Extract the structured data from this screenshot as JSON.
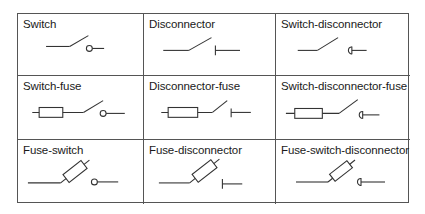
{
  "diagram": {
    "line_color": "#333333",
    "border_color": "#555555",
    "cells": [
      {
        "label": "Switch",
        "row": 1,
        "col": 1,
        "symbol": "switch-icon",
        "contact": "circle",
        "fuse": "none"
      },
      {
        "label": "Disconnector",
        "row": 1,
        "col": 2,
        "symbol": "disconnector-icon",
        "contact": "bar",
        "fuse": "none"
      },
      {
        "label": "Switch-disconnector",
        "row": 1,
        "col": 3,
        "symbol": "switch-disconnector-icon",
        "contact": "half-circle-bar",
        "fuse": "none"
      },
      {
        "label": "Switch-fuse",
        "row": 2,
        "col": 1,
        "symbol": "switch-fuse-icon",
        "contact": "circle",
        "fuse": "in-line"
      },
      {
        "label": "Disconnector-fuse",
        "row": 2,
        "col": 2,
        "symbol": "disconnector-fuse-icon",
        "contact": "bar",
        "fuse": "in-line"
      },
      {
        "label": "Switch-disconnector-fuse",
        "row": 2,
        "col": 3,
        "symbol": "switch-disconnector-fuse-icon",
        "contact": "half-circle-bar",
        "fuse": "in-line"
      },
      {
        "label": "Fuse-switch",
        "row": 3,
        "col": 1,
        "symbol": "fuse-switch-icon",
        "contact": "circle",
        "fuse": "on-blade"
      },
      {
        "label": "Fuse-disconnector",
        "row": 3,
        "col": 2,
        "symbol": "fuse-disconnector-icon",
        "contact": "bar",
        "fuse": "on-blade"
      },
      {
        "label": "Fuse-switch-disconnector",
        "row": 3,
        "col": 3,
        "symbol": "fuse-switch-disconnector-icon",
        "contact": "half-circle-bar",
        "fuse": "on-blade"
      }
    ]
  }
}
